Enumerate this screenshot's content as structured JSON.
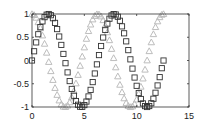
{
  "chart_data": {
    "type": "scatter",
    "title": "",
    "xlabel": "",
    "ylabel": "",
    "xlim": [
      0,
      15
    ],
    "ylim": [
      -1,
      1
    ],
    "grid": false,
    "legend": null,
    "x_ticks": [
      0,
      5,
      10,
      15
    ],
    "x_tick_labels": [
      "0",
      "5",
      "10",
      "15"
    ],
    "y_ticks": [
      1,
      0.5,
      0,
      -0.5,
      -1
    ],
    "y_tick_labels": [
      "1",
      "0.5",
      "0",
      "-0.5",
      "-1"
    ],
    "x": {
      "start": 0,
      "end": 12.566,
      "step": 0.2
    },
    "series": [
      {
        "name": "sin(x)",
        "function": "sin",
        "marker": "square",
        "color": "#333333"
      },
      {
        "name": "cos(x)",
        "function": "cos",
        "marker": "triangle",
        "color": "#bbbbbb"
      }
    ]
  },
  "colors": {
    "axes": "#333333",
    "background": "#ffffff",
    "sin_marker": "#333333",
    "cos_marker": "#bdbdbd"
  }
}
